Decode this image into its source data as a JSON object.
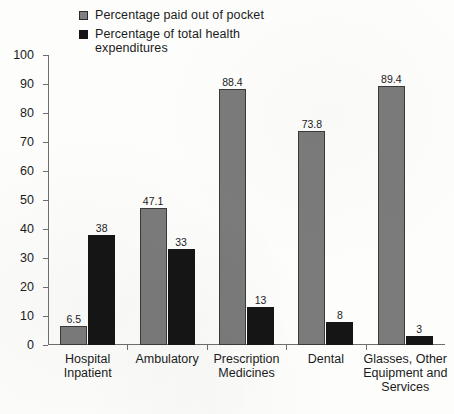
{
  "chart_data": {
    "type": "bar",
    "title": "",
    "subtitle": "",
    "xlabel": "",
    "ylabel": "",
    "ylim": [
      0,
      100
    ],
    "y_ticks": [
      0,
      10,
      20,
      30,
      40,
      50,
      60,
      70,
      80,
      90,
      100
    ],
    "grid": false,
    "legend_position": "top",
    "categories": [
      "Hospital Inpatient",
      "Ambulatory",
      "Prescription Medicines",
      "Dental",
      "Glasses, Other Equipment and Services"
    ],
    "series": [
      {
        "name": "Percentage paid out of pocket",
        "color": "#7b7b7b",
        "values": [
          6.5,
          47.1,
          88.4,
          73.8,
          89.4
        ],
        "labels": [
          "6.5",
          "47.1",
          "88.4",
          "73.8",
          "89.4"
        ]
      },
      {
        "name": "Percentage of total health expenditures",
        "color": "#151515",
        "values": [
          38,
          33,
          13,
          8,
          3
        ],
        "labels": [
          "38",
          "33",
          "13",
          "8",
          "3"
        ]
      }
    ]
  },
  "legend": {
    "entries": [
      {
        "label": "Percentage paid out of pocket",
        "swatch": "series-gray"
      },
      {
        "label": "Percentage of total health expenditures",
        "swatch": "series-black"
      }
    ]
  },
  "axis": {
    "y_tick_labels": [
      "100",
      "90",
      "80",
      "70",
      "60",
      "50",
      "40",
      "30",
      "20",
      "10",
      "0"
    ]
  },
  "category_labels": [
    "Hospital Inpatient",
    "Ambulatory",
    "Prescription Medicines",
    "Dental",
    "Glasses, Other Equipment and Services"
  ]
}
